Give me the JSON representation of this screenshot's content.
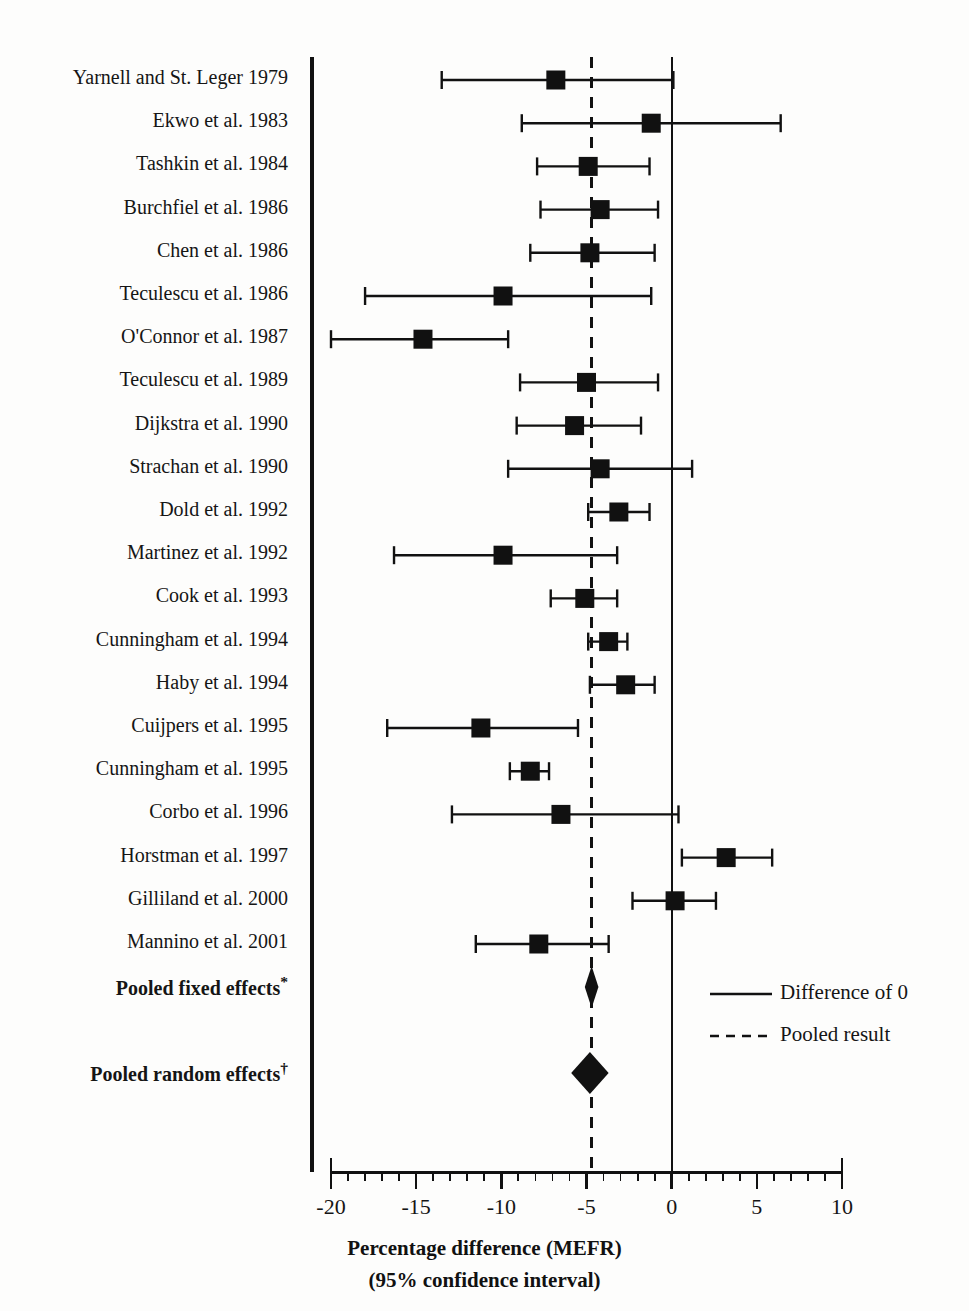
{
  "chart_data": {
    "type": "forest",
    "title": "",
    "xlabel_line1": "Percentage difference (MEFR)",
    "xlabel_line2": "(95% confidence interval)",
    "xlim": [
      -20,
      10
    ],
    "xticks": [
      -20,
      -15,
      -10,
      -5,
      0,
      5,
      10
    ],
    "xticklabels": [
      "-20",
      "-15",
      "-10",
      "-5",
      "0",
      "5",
      "10"
    ],
    "minor_tick_step": 1,
    "reference_line": 0,
    "pooled_line": -4.7,
    "grid": false,
    "legend_position": "bottom-right",
    "legend": [
      {
        "label": "Difference of 0",
        "style": "solid"
      },
      {
        "label": "Pooled result",
        "style": "dashed"
      }
    ],
    "studies": [
      {
        "label": "Yarnell and St. Leger 1979",
        "estimate": -6.8,
        "ci_low": -13.5,
        "ci_high": 0.1,
        "marker": "square"
      },
      {
        "label": "Ekwo et al. 1983",
        "estimate": -1.2,
        "ci_low": -8.8,
        "ci_high": 6.4,
        "marker": "square"
      },
      {
        "label": "Tashkin et al. 1984",
        "estimate": -4.9,
        "ci_low": -7.9,
        "ci_high": -1.3,
        "marker": "square"
      },
      {
        "label": "Burchfiel et al. 1986",
        "estimate": -4.2,
        "ci_low": -7.7,
        "ci_high": -0.8,
        "marker": "square"
      },
      {
        "label": "Chen et al. 1986",
        "estimate": -4.8,
        "ci_low": -8.3,
        "ci_high": -1.0,
        "marker": "square"
      },
      {
        "label": "Teculescu et al. 1986",
        "estimate": -9.9,
        "ci_low": -18.0,
        "ci_high": -1.2,
        "marker": "square"
      },
      {
        "label": "O'Connor et al. 1987",
        "estimate": -14.6,
        "ci_low": -20.0,
        "ci_high": -9.6,
        "marker": "square"
      },
      {
        "label": "Teculescu et al. 1989",
        "estimate": -5.0,
        "ci_low": -8.9,
        "ci_high": -0.8,
        "marker": "square"
      },
      {
        "label": "Dijkstra et al. 1990",
        "estimate": -5.7,
        "ci_low": -9.1,
        "ci_high": -1.8,
        "marker": "square"
      },
      {
        "label": "Strachan et al. 1990",
        "estimate": -4.2,
        "ci_low": -9.6,
        "ci_high": 1.2,
        "marker": "square"
      },
      {
        "label": "Dold et al. 1992",
        "estimate": -3.1,
        "ci_low": -4.9,
        "ci_high": -1.3,
        "marker": "square"
      },
      {
        "label": "Martinez et al. 1992",
        "estimate": -9.9,
        "ci_low": -16.3,
        "ci_high": -3.2,
        "marker": "square"
      },
      {
        "label": "Cook et al. 1993",
        "estimate": -5.1,
        "ci_low": -7.1,
        "ci_high": -3.2,
        "marker": "square"
      },
      {
        "label": "Cunningham et al. 1994",
        "estimate": -3.7,
        "ci_low": -4.9,
        "ci_high": -2.6,
        "marker": "square"
      },
      {
        "label": "Haby et al. 1994",
        "estimate": -2.7,
        "ci_low": -4.8,
        "ci_high": -1.0,
        "marker": "square"
      },
      {
        "label": "Cuijpers et al. 1995",
        "estimate": -11.2,
        "ci_low": -16.7,
        "ci_high": -5.5,
        "marker": "square"
      },
      {
        "label": "Cunningham et al. 1995",
        "estimate": -8.3,
        "ci_low": -9.5,
        "ci_high": -7.2,
        "marker": "square"
      },
      {
        "label": "Corbo et al. 1996",
        "estimate": -6.5,
        "ci_low": -12.9,
        "ci_high": 0.4,
        "marker": "square"
      },
      {
        "label": "Horstman et al. 1997",
        "estimate": 3.2,
        "ci_low": 0.6,
        "ci_high": 5.9,
        "marker": "square"
      },
      {
        "label": "Gilliland et al. 2000",
        "estimate": 0.2,
        "ci_low": -2.3,
        "ci_high": 2.6,
        "marker": "square"
      },
      {
        "label": "Mannino et al. 2001",
        "estimate": -7.8,
        "ci_low": -11.5,
        "ci_high": -3.7,
        "marker": "square"
      }
    ],
    "pooled": [
      {
        "label": "Pooled fixed effects",
        "footnote": "*",
        "estimate": -4.7,
        "ci_low": -5.1,
        "ci_high": -4.3,
        "marker": "diamond"
      },
      {
        "label": "Pooled random effects",
        "footnote": "†",
        "estimate": -4.8,
        "ci_low": -5.9,
        "ci_high": -3.7,
        "marker": "diamond"
      }
    ]
  },
  "colors": {
    "ink": "#111111",
    "background": "#fdfdfc"
  }
}
